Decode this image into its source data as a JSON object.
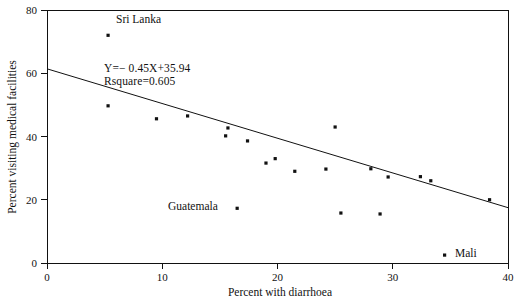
{
  "chart_data": {
    "type": "scatter",
    "title": "",
    "xlabel": "Percent with diarrhoea",
    "ylabel": "Percent visiting medical facilities",
    "xlim": [
      0,
      40
    ],
    "ylim": [
      0,
      80
    ],
    "xticks": [
      0,
      10,
      20,
      30,
      40
    ],
    "yticks": [
      0,
      20,
      40,
      60,
      80
    ],
    "xtick_labels": [
      "0",
      "10",
      "20",
      "30",
      "40"
    ],
    "ytick_labels": [
      "0",
      "20",
      "40",
      "60",
      "80"
    ],
    "grid": false,
    "legend": "none",
    "points": [
      {
        "x": 5.3,
        "y": 72.0,
        "label": "Sri Lanka"
      },
      {
        "x": 5.3,
        "y": 49.7,
        "label": ""
      },
      {
        "x": 9.5,
        "y": 45.6,
        "label": ""
      },
      {
        "x": 12.2,
        "y": 46.5,
        "label": ""
      },
      {
        "x": 15.7,
        "y": 42.7,
        "label": ""
      },
      {
        "x": 15.5,
        "y": 40.2,
        "label": ""
      },
      {
        "x": 17.4,
        "y": 38.6,
        "label": ""
      },
      {
        "x": 16.5,
        "y": 17.3,
        "label": "Guatemala"
      },
      {
        "x": 19.0,
        "y": 31.6,
        "label": ""
      },
      {
        "x": 19.8,
        "y": 33.0,
        "label": ""
      },
      {
        "x": 21.5,
        "y": 29.0,
        "label": ""
      },
      {
        "x": 24.2,
        "y": 29.7,
        "label": ""
      },
      {
        "x": 25.0,
        "y": 43.0,
        "label": ""
      },
      {
        "x": 25.5,
        "y": 15.8,
        "label": ""
      },
      {
        "x": 28.1,
        "y": 29.8,
        "label": ""
      },
      {
        "x": 29.6,
        "y": 27.2,
        "label": ""
      },
      {
        "x": 28.9,
        "y": 15.5,
        "label": ""
      },
      {
        "x": 32.4,
        "y": 27.3,
        "label": ""
      },
      {
        "x": 33.3,
        "y": 26.0,
        "label": ""
      },
      {
        "x": 34.5,
        "y": 2.5,
        "label": "Mali"
      },
      {
        "x": 38.4,
        "y": 20.0,
        "label": ""
      }
    ],
    "fit_line": {
      "x_start": 0,
      "y_start": 61.4,
      "x_end": 40,
      "y_end": 17.5,
      "equation": "Y=− 0.45X+35.94",
      "rsquare": "Rsquare=0.605"
    },
    "annotations": [
      {
        "name": "sri-lanka",
        "text": "Sri Lanka"
      },
      {
        "name": "guatemala",
        "text": "Guatemala"
      },
      {
        "name": "mali",
        "text": "Mali"
      }
    ]
  }
}
